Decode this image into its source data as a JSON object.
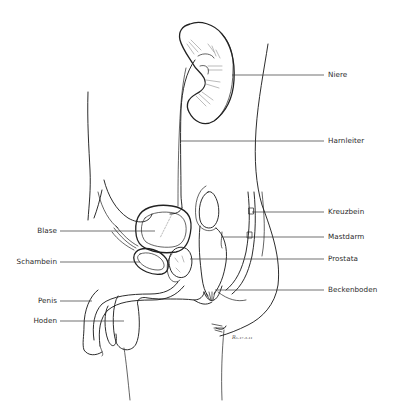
{
  "figure": {
    "background": "#ffffff",
    "line_color": "#222222",
    "signature": "R. 17.3.11"
  },
  "labels": {
    "right": [
      {
        "id": "niere",
        "text": "Niere",
        "y": 75
      },
      {
        "id": "harnleiter",
        "text": "Harnleiter",
        "y": 141
      },
      {
        "id": "kreuzbein",
        "text": "Kreuzbein",
        "y": 212
      },
      {
        "id": "mastdarm",
        "text": "Mastdarm",
        "y": 237
      },
      {
        "id": "prostata",
        "text": "Prostata",
        "y": 259
      },
      {
        "id": "beckenboden",
        "text": "Beckenboden",
        "y": 290
      }
    ],
    "left": [
      {
        "id": "blase",
        "text": "Blase",
        "y": 231
      },
      {
        "id": "schambein",
        "text": "Schambein",
        "y": 262
      },
      {
        "id": "penis",
        "text": "Penis",
        "y": 301
      },
      {
        "id": "hoden",
        "text": "Hoden",
        "y": 321
      }
    ]
  }
}
